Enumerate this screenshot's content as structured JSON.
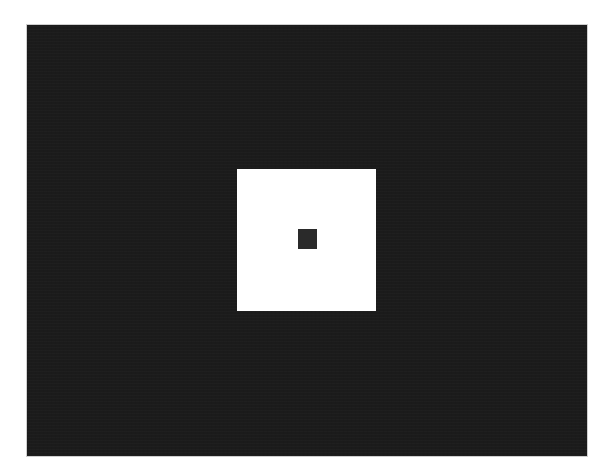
{
  "figure": {
    "colors": {
      "page_background": "#ffffff",
      "field": "#1b1b1b",
      "field_border": "#cfcfcf",
      "white_square": "#ffffff",
      "center_square": "#2a2a2a"
    },
    "shapes": [
      {
        "name": "dark-field",
        "x": 26,
        "y": 24,
        "width": 562,
        "height": 433
      },
      {
        "name": "white-square",
        "x": 237,
        "y": 169,
        "width": 139,
        "height": 142
      },
      {
        "name": "center-square",
        "x": 298,
        "y": 229,
        "width": 19,
        "height": 20
      }
    ]
  }
}
